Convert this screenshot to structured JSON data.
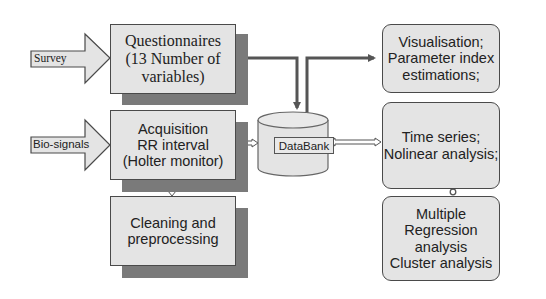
{
  "inputs": [
    {
      "label": "Survey"
    },
    {
      "label": "Bio-signals"
    }
  ],
  "boxes": {
    "questionnaires": {
      "lines": [
        "Questionnaires",
        "(13 Number of",
        "variables)"
      ]
    },
    "acquisition": {
      "lines": [
        "Acquisition",
        "RR interval",
        "(Holter monitor)"
      ]
    },
    "cleaning": {
      "lines": [
        "Cleaning and",
        "preprocessing"
      ]
    },
    "databank": {
      "label": "DataBank"
    },
    "visualisation": {
      "lines": [
        "Visualisation;",
        "Parameter index",
        "estimations;"
      ]
    },
    "timeseries": {
      "lines": [
        "Time series;",
        "Nolinear analysis;"
      ]
    },
    "regression": {
      "lines": [
        "Multiple",
        "Regression",
        "analysis",
        "Cluster analysis"
      ]
    }
  },
  "colors": {
    "box_fill": "#e4e4e4",
    "border": "#4a4a4a",
    "shadow": "#7a7a7a",
    "arrow": "#555555"
  }
}
